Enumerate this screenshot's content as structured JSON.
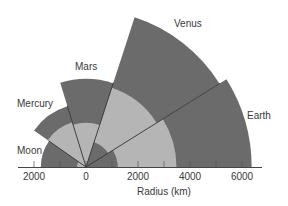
{
  "diagram": {
    "title": "",
    "axis": {
      "label": "Radius (km)",
      "ticks": [
        {
          "value": -2000,
          "label": "2000"
        },
        {
          "value": 0,
          "label": "0"
        },
        {
          "value": 2000,
          "label": "2000"
        },
        {
          "value": 4000,
          "label": "4000"
        },
        {
          "value": 6000,
          "label": "6000"
        }
      ]
    },
    "colors": {
      "outer_layer": "#6b6b6b",
      "core": "#b5b5b5",
      "inner_core": "#8a8a8a",
      "divider": "#2a2a2a",
      "axis": "#444444"
    },
    "bodies": [
      {
        "name": "Earth",
        "radius_km": 6371,
        "core_km": 3480,
        "start_deg": 0,
        "end_deg": 32
      },
      {
        "name": "Venus",
        "radius_km": 6052,
        "core_km": 3200,
        "start_deg": 32,
        "end_deg": 72
      },
      {
        "name": "Mars",
        "radius_km": 3390,
        "core_km": 1700,
        "start_deg": 72,
        "end_deg": 107
      },
      {
        "name": "Mercury",
        "radius_km": 2440,
        "core_km": 1800,
        "start_deg": 107,
        "end_deg": 145
      },
      {
        "name": "Moon",
        "radius_km": 1737,
        "core_km": 350,
        "start_deg": 145,
        "end_deg": 180
      }
    ],
    "labels": {
      "earth": "Earth",
      "venus": "Venus",
      "mars": "Mars",
      "mercury": "Mercury",
      "moon": "Moon"
    }
  }
}
